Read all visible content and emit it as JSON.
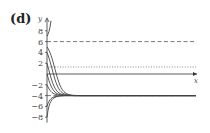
{
  "panel_label": "(d)",
  "chart_data": {
    "type": "line",
    "title": "(d)",
    "xlabel": "x",
    "ylabel": "y",
    "ylim": [
      -9,
      10
    ],
    "y_ticks": [
      8,
      6,
      4,
      2,
      -2,
      -4,
      -6,
      -8
    ],
    "y_tick_labels": [
      "8",
      "6",
      "4",
      "2",
      "−2",
      "−4",
      "−6",
      "−8"
    ],
    "grid": false,
    "equilibria": [
      {
        "y": 6,
        "style": "dashed",
        "label": "stable/unstable equilibrium y = 6"
      },
      {
        "y": -4,
        "style": "dashed",
        "label": "equilibrium y = -4"
      }
    ],
    "reference_lines": [
      {
        "y": 1.3,
        "style": "dotted",
        "label": "inflection line"
      }
    ],
    "series": [
      {
        "name": "y0=7",
        "initial_y": 7,
        "behavior": "increasing, diverging upward"
      },
      {
        "name": "y0=5",
        "initial_y": 5,
        "behavior": "decreasing toward -4"
      },
      {
        "name": "y0=4",
        "initial_y": 4,
        "behavior": "decreasing toward -4"
      },
      {
        "name": "y0=2",
        "initial_y": 2,
        "behavior": "decreasing toward -4"
      },
      {
        "name": "y0=0",
        "initial_y": 0,
        "behavior": "decreasing toward -4"
      },
      {
        "name": "y0=-2",
        "initial_y": -2,
        "behavior": "decreasing toward -4"
      },
      {
        "name": "y0=-6",
        "initial_y": -6,
        "behavior": "increasing toward -4"
      },
      {
        "name": "y0=-8",
        "initial_y": -8,
        "behavior": "increasing toward -4"
      }
    ]
  }
}
